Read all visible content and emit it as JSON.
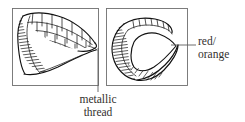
{
  "figure": {
    "background_color": "#ffffff",
    "ink_color": "#111111",
    "frame_color": "#6f6f6f",
    "leader_color": "#5d5d5d",
    "panels": [
      {
        "id": "left-panel",
        "name": "wing-outline-panel",
        "description": "open wing form with scalloped cell grid and hatched leading band",
        "frame": {
          "x": 12,
          "y": 8,
          "width": 87,
          "height": 78
        }
      },
      {
        "id": "right-panel",
        "name": "wing-teardrop-panel",
        "description": "closed teardrop wing form with hatched band, cell row and inner pointed oval",
        "frame": {
          "x": 106,
          "y": 8,
          "width": 82,
          "height": 78
        }
      }
    ],
    "callouts": [
      {
        "id": "metallic-thread",
        "name": "metallic-thread-callout",
        "lines": [
          "metallic",
          "thread"
        ],
        "leader": {
          "from_x": 98,
          "from_y": 48,
          "to_x": 98,
          "to_y": 92
        },
        "anchor": "bottom"
      },
      {
        "id": "red-orange",
        "name": "red-orange-callout",
        "lines": [
          "red/",
          "orange"
        ],
        "leader": {
          "from_x": 171,
          "from_y": 45,
          "to_x": 196,
          "to_y": 45
        },
        "anchor": "right"
      }
    ]
  }
}
